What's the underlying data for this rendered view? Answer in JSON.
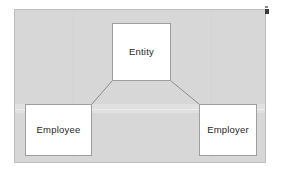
{
  "diagram": {
    "type": "hierarchy",
    "title": "",
    "background_color": "#d7d7d7",
    "panel_border_color": "#bdbdbd",
    "node_fill_color": "#ffffff",
    "node_border_color": "#9e9e9e",
    "connector_color": "#8c8c8c",
    "nodes": [
      {
        "id": "entity",
        "label": "Entity"
      },
      {
        "id": "employee",
        "label": "Employee"
      },
      {
        "id": "employer",
        "label": "Employer"
      }
    ],
    "edges": [
      {
        "from": "entity",
        "to": "employee"
      },
      {
        "from": "entity",
        "to": "employer"
      }
    ],
    "artifacts": {
      "corner_marker": "corner-marker-icon"
    }
  }
}
